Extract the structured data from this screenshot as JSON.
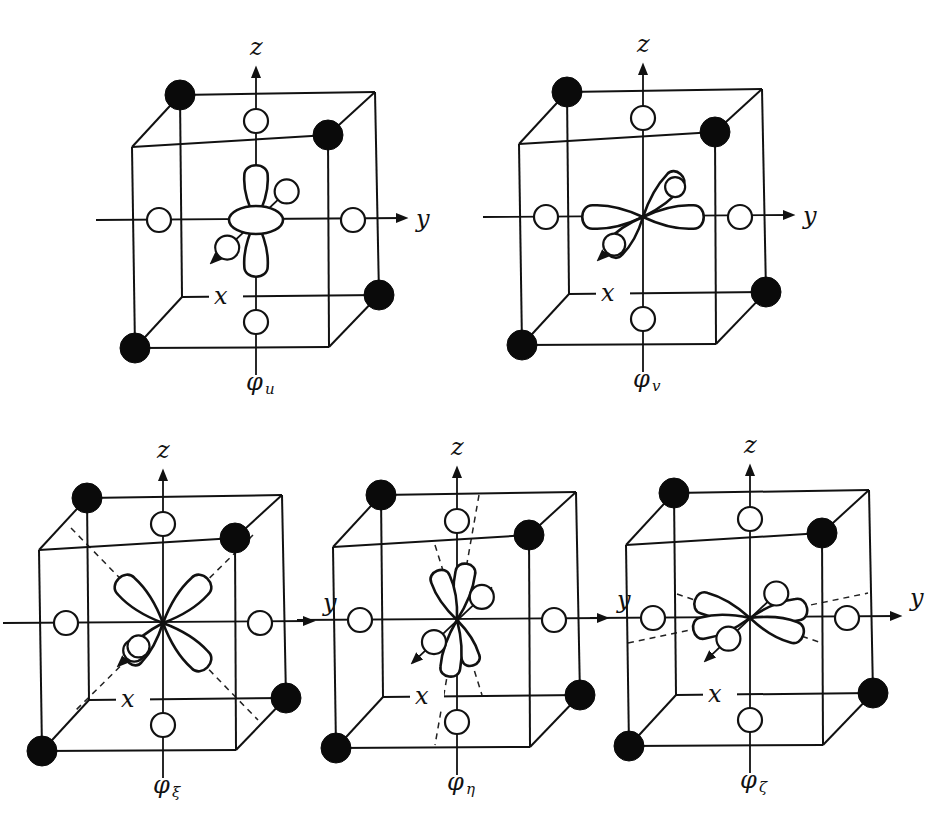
{
  "figure": {
    "colors": {
      "line": "#111111",
      "filled_atom": "#0a0a0a",
      "background": "#ffffff"
    },
    "axis_labels": {
      "x": "x",
      "y": "y",
      "z": "z"
    },
    "panels": [
      {
        "id": "u",
        "caption_main": "φ",
        "caption_sub": "u",
        "orbital": "dz2",
        "origin": [
          256,
          220
        ]
      },
      {
        "id": "v",
        "caption_main": "φ",
        "caption_sub": "v",
        "orbital": "dx2y2",
        "origin": [
          643,
          217
        ]
      },
      {
        "id": "xi",
        "caption_main": "φ",
        "caption_sub": "ξ",
        "orbital": "dyz",
        "origin": [
          163,
          623
        ]
      },
      {
        "id": "eta",
        "caption_main": "φ",
        "caption_sub": "η",
        "orbital": "dzx",
        "origin": [
          457,
          620
        ]
      },
      {
        "id": "zeta",
        "caption_main": "φ",
        "caption_sub": "ζ",
        "orbital": "dxy",
        "origin": [
          750,
          618
        ]
      }
    ],
    "atoms": {
      "filled_description": "four filled (black) atoms at alternating cube corners",
      "open_description": "six open (white) ligands on the ±x, ±y, ±z axes at face centers"
    }
  }
}
